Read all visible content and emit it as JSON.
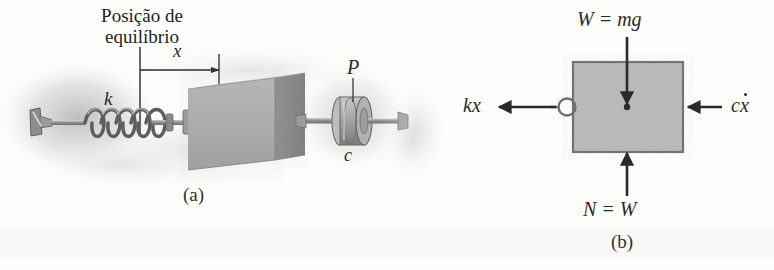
{
  "figure": {
    "background_color": "#fdfdfc",
    "ink_color": "#2a2a2a",
    "block_face_color": "#b0b0b0",
    "block_side_color": "#8a8a8a",
    "fbd_box_fill": "#b9b9b9",
    "fbd_box_stroke": "#6e6e6e",
    "smudge_color": "#bfbfbf"
  },
  "panel_a": {
    "caption": "(a)",
    "equilibrium_label_line1": "Posição de",
    "equilibrium_label_line2": "equilíbrio",
    "displacement_symbol": "x",
    "spring_constant_symbol": "k",
    "point_symbol": "P",
    "damping_symbol": "c"
  },
  "panel_b": {
    "caption": "(b)",
    "weight_label": "W = mg",
    "spring_force_label": "kx",
    "damping_force_label_prefix": "c",
    "damping_force_label_var": "x",
    "normal_force_label": "N = W"
  }
}
